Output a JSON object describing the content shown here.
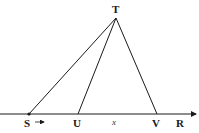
{
  "diagram": {
    "points": {
      "T": {
        "label": "T",
        "x": 116,
        "y": 18
      },
      "S": {
        "label": "S",
        "x": 29,
        "y": 114
      },
      "U": {
        "label": "U",
        "x": 78,
        "y": 114
      },
      "V": {
        "label": "V",
        "x": 157,
        "y": 114
      },
      "R": {
        "label": "R",
        "x": 180,
        "y": 114
      }
    },
    "segment_label": "x",
    "line_color": "#1a1a1a"
  }
}
